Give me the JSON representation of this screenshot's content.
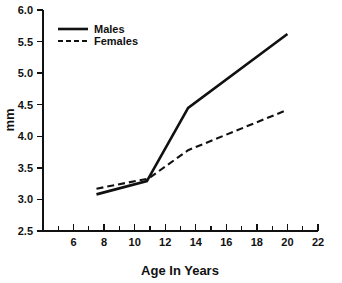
{
  "chart_data": {
    "type": "line",
    "title": "",
    "subtitle": "",
    "xlabel": "Age In Years",
    "ylabel": "mm",
    "xlim": [
      4,
      22
    ],
    "ylim": [
      2.5,
      6.0
    ],
    "grid": false,
    "legend_position": "top-left",
    "x_ticks_major": [
      6,
      8,
      10,
      12,
      14,
      16,
      18,
      20,
      22
    ],
    "x_tick_labels": [
      "6",
      "8",
      "10",
      "12",
      "14",
      "16",
      "18",
      "20",
      "22"
    ],
    "x_ticks_minor": [
      5,
      7,
      9,
      11,
      13,
      15,
      17,
      19,
      21
    ],
    "y_ticks_major": [
      2.5,
      3.0,
      3.5,
      4.0,
      4.5,
      5.0,
      5.5,
      6.0
    ],
    "y_tick_labels": [
      "2.5",
      "3.0",
      "3.5",
      "4.0",
      "4.5",
      "5.0",
      "5.5",
      "6.0"
    ],
    "series": [
      {
        "name": "Males",
        "style": "solid",
        "color": "#111111",
        "x": [
          7.5,
          10.8,
          13.5,
          20.0
        ],
        "values": [
          3.08,
          3.29,
          4.45,
          5.62
        ]
      },
      {
        "name": "Females",
        "style": "dashed",
        "color": "#111111",
        "x": [
          7.5,
          10.9,
          13.5,
          20.0
        ],
        "values": [
          3.17,
          3.33,
          3.78,
          4.42
        ]
      }
    ],
    "annotations": []
  },
  "legend": {
    "items": [
      {
        "label": "Males",
        "style": "solid"
      },
      {
        "label": "Females",
        "style": "dashed"
      }
    ]
  },
  "axes": {
    "x_title": "Age In Years",
    "y_title": "mm"
  }
}
